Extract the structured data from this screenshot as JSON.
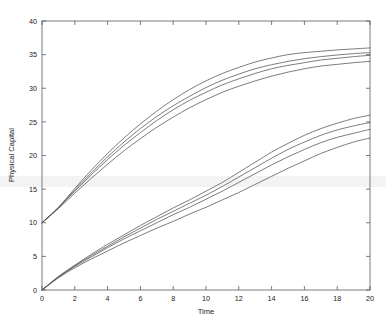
{
  "chart_data": {
    "type": "line",
    "title": "",
    "xlabel": "Time",
    "ylabel": "Physical Capital",
    "xlim": [
      0,
      20
    ],
    "ylim": [
      0,
      40
    ],
    "xticks": [
      0,
      2,
      4,
      6,
      8,
      10,
      12,
      14,
      16,
      18,
      20
    ],
    "yticks": [
      0,
      5,
      10,
      15,
      20,
      25,
      30,
      35,
      40
    ],
    "xticklabels": [
      "0",
      "2",
      "4",
      "6",
      "8",
      "10",
      "12",
      "14",
      "16",
      "18",
      "20"
    ],
    "yticklabels": [
      "0",
      "5",
      "10",
      "15",
      "20",
      "25",
      "30",
      "35",
      "40"
    ],
    "grid": false,
    "legend": null,
    "box": true,
    "tick_direction": "in",
    "line_color": "#4d5256",
    "x": [
      0,
      1,
      2,
      3,
      4,
      5,
      6,
      7,
      8,
      9,
      10,
      11,
      12,
      13,
      14,
      15,
      16,
      17,
      18,
      19,
      20
    ],
    "series": [
      {
        "name": "high-initial-capital-1",
        "group": "upper",
        "values": [
          10.0,
          12.3,
          15.1,
          17.8,
          20.3,
          22.6,
          24.7,
          26.6,
          28.3,
          29.8,
          31.1,
          32.2,
          33.1,
          33.9,
          34.5,
          35.0,
          35.3,
          35.5,
          35.7,
          35.85,
          36.0
        ]
      },
      {
        "name": "high-initial-capital-2",
        "group": "upper",
        "values": [
          10.0,
          12.25,
          14.9,
          17.4,
          19.8,
          22.0,
          24.0,
          25.8,
          27.4,
          28.8,
          30.1,
          31.2,
          32.1,
          32.9,
          33.5,
          34.0,
          34.4,
          34.7,
          34.95,
          35.15,
          35.3
        ]
      },
      {
        "name": "high-initial-capital-3",
        "group": "upper",
        "values": [
          10.0,
          12.2,
          14.7,
          17.1,
          19.4,
          21.5,
          23.4,
          25.2,
          26.8,
          28.2,
          29.4,
          30.5,
          31.4,
          32.2,
          32.9,
          33.4,
          33.8,
          34.2,
          34.45,
          34.7,
          34.9
        ]
      },
      {
        "name": "high-initial-capital-4",
        "group": "upper",
        "values": [
          10.0,
          12.1,
          14.4,
          16.6,
          18.7,
          20.7,
          22.5,
          24.2,
          25.7,
          27.1,
          28.3,
          29.4,
          30.3,
          31.1,
          31.8,
          32.4,
          32.9,
          33.3,
          33.55,
          33.8,
          34.0
        ]
      },
      {
        "name": "low-initial-capital-1",
        "group": "lower",
        "values": [
          0.0,
          2.0,
          3.7,
          5.3,
          6.8,
          8.2,
          9.6,
          10.9,
          12.2,
          13.4,
          14.7,
          16.0,
          17.5,
          19.0,
          20.5,
          21.8,
          23.0,
          24.0,
          24.8,
          25.5,
          26.0
        ]
      },
      {
        "name": "low-initial-capital-2",
        "group": "lower",
        "values": [
          0.0,
          1.95,
          3.6,
          5.1,
          6.5,
          7.9,
          9.2,
          10.5,
          11.7,
          12.9,
          14.1,
          15.4,
          16.8,
          18.2,
          19.6,
          20.9,
          22.0,
          23.0,
          23.8,
          24.4,
          24.9
        ]
      },
      {
        "name": "low-initial-capital-3",
        "group": "lower",
        "values": [
          0.0,
          1.9,
          3.5,
          4.9,
          6.3,
          7.6,
          8.8,
          10.0,
          11.2,
          12.3,
          13.5,
          14.7,
          16.0,
          17.3,
          18.6,
          19.8,
          20.9,
          21.9,
          22.7,
          23.3,
          23.9
        ]
      },
      {
        "name": "low-initial-capital-4",
        "group": "lower",
        "values": [
          0.0,
          1.8,
          3.3,
          4.6,
          5.8,
          7.0,
          8.1,
          9.2,
          10.2,
          11.3,
          12.3,
          13.4,
          14.5,
          15.7,
          16.9,
          18.1,
          19.2,
          20.3,
          21.2,
          22.0,
          22.6
        ]
      }
    ]
  }
}
